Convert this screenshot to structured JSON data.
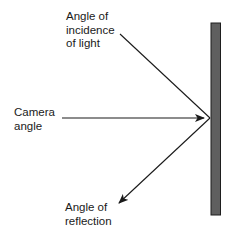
{
  "diagram": {
    "labels": {
      "incidence": "Angle of\nincidence\nof light",
      "camera": "Camera\nangle",
      "reflection": "Angle of\nreflection"
    },
    "surface": {
      "name": "reflective-surface",
      "fill": "#5f5f5f",
      "stroke": "#1e1e1e"
    },
    "rays": [
      {
        "name": "incidence-ray",
        "from": [
          120,
          34
        ],
        "to": [
          210,
          118
        ],
        "arrow": "none"
      },
      {
        "name": "camera-ray",
        "from": [
          62,
          118
        ],
        "to": [
          204,
          118
        ],
        "arrow": "end"
      },
      {
        "name": "reflection-ray",
        "from": [
          210,
          118
        ],
        "to": [
          119,
          203
        ],
        "arrow": "end"
      }
    ],
    "line_color": "#1a1a1a"
  }
}
